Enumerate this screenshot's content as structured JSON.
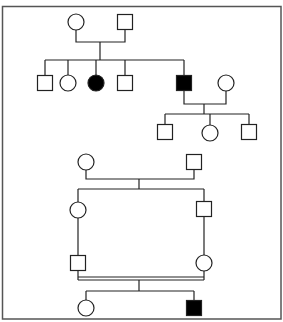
{
  "diagram": {
    "type": "pedigree",
    "colors": {
      "line": "#222222",
      "affected": "#000000",
      "unaffected": "#ffffff",
      "frame": "#555555"
    },
    "frame": {
      "x": 2,
      "y": 6,
      "width": 279,
      "height": 313
    },
    "top_pedigree": {
      "generation_I": [
        {
          "id": "I-1",
          "sex": "female",
          "affected": false,
          "cx": 76,
          "cy": 22
        },
        {
          "id": "I-2",
          "sex": "male",
          "affected": false,
          "cx": 125,
          "cy": 22
        }
      ],
      "generation_II": [
        {
          "id": "II-1",
          "sex": "male",
          "affected": false,
          "cx": 45,
          "cy": 83
        },
        {
          "id": "II-2",
          "sex": "female",
          "affected": false,
          "cx": 68,
          "cy": 83
        },
        {
          "id": "II-3",
          "sex": "female",
          "affected": true,
          "cx": 96,
          "cy": 83
        },
        {
          "id": "II-4",
          "sex": "male",
          "affected": false,
          "cx": 125,
          "cy": 83
        },
        {
          "id": "II-5",
          "sex": "male",
          "affected": true,
          "cx": 184,
          "cy": 83
        },
        {
          "id": "II-6",
          "sex": "female",
          "affected": false,
          "cx": 226,
          "cy": 83,
          "spouse_of": "II-5"
        }
      ],
      "generation_III": [
        {
          "id": "III-1",
          "sex": "male",
          "affected": false,
          "cx": 165,
          "cy": 132
        },
        {
          "id": "III-2",
          "sex": "female",
          "affected": false,
          "cx": 210,
          "cy": 133
        },
        {
          "id": "III-3",
          "sex": "male",
          "affected": false,
          "cx": 249,
          "cy": 132
        }
      ]
    },
    "bottom_pedigree": {
      "generation_I": [
        {
          "id": "B-I-1",
          "sex": "female",
          "affected": false,
          "cx": 86,
          "cy": 162
        },
        {
          "id": "B-I-2",
          "sex": "male",
          "affected": false,
          "cx": 194,
          "cy": 162
        }
      ],
      "generation_II": [
        {
          "id": "B-II-1",
          "sex": "female",
          "affected": false,
          "cx": 78,
          "cy": 210
        },
        {
          "id": "B-II-2",
          "sex": "male",
          "affected": false,
          "cx": 204,
          "cy": 209
        }
      ],
      "generation_III": [
        {
          "id": "B-III-1",
          "sex": "male",
          "affected": false,
          "cx": 78,
          "cy": 263
        },
        {
          "id": "B-III-2",
          "sex": "female",
          "affected": false,
          "cx": 204,
          "cy": 263
        }
      ],
      "consanguineous_mating": {
        "between": [
          "B-III-1",
          "B-III-2"
        ],
        "double_line": true
      },
      "generation_IV": [
        {
          "id": "B-IV-1",
          "sex": "female",
          "affected": false,
          "cx": 86,
          "cy": 308
        },
        {
          "id": "B-IV-2",
          "sex": "male",
          "affected": true,
          "cx": 194,
          "cy": 308
        }
      ]
    },
    "symbol_size": 15,
    "legend": {
      "square": "male",
      "circle": "female",
      "filled": "affected",
      "double_line": "consanguineous mating"
    }
  }
}
